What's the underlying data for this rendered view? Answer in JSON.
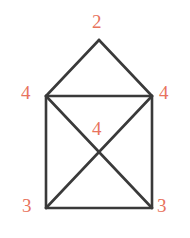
{
  "figure": {
    "kind": "geometry-diagram",
    "background_color": "#ffffff",
    "stroke_color": "#3a3a3a",
    "label_color": "#e8735d",
    "stroke_width": 2.6,
    "labels": {
      "apex": "2",
      "left_mid": "4",
      "right_mid": "4",
      "center": "4",
      "bottom_left": "3",
      "bottom_right": "3"
    },
    "points": {
      "apex": [
        99,
        40
      ],
      "top_left": [
        46,
        96
      ],
      "top_right": [
        152,
        96
      ],
      "bottom_left": [
        46,
        208
      ],
      "bottom_right": [
        152,
        208
      ],
      "crossing": [
        99,
        152
      ]
    },
    "edges": [
      [
        "apex",
        "top_left"
      ],
      [
        "apex",
        "top_right"
      ],
      [
        "top_left",
        "top_right"
      ],
      [
        "top_left",
        "bottom_left"
      ],
      [
        "top_right",
        "bottom_right"
      ],
      [
        "bottom_left",
        "bottom_right"
      ],
      [
        "top_left",
        "bottom_right"
      ],
      [
        "top_right",
        "bottom_left"
      ]
    ]
  }
}
